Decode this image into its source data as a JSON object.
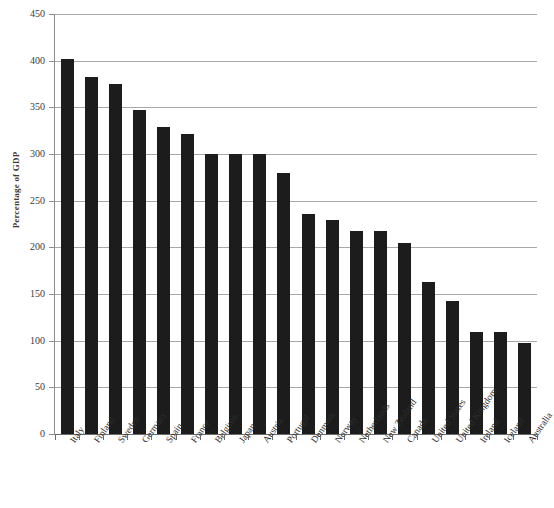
{
  "chart_data": {
    "type": "bar",
    "title": "",
    "xlabel": "",
    "ylabel": "Percentage of GDP",
    "ylim": [
      0,
      450
    ],
    "ytick_step": 50,
    "yticks": [
      "0",
      "50",
      "100",
      "150",
      "200",
      "250",
      "300",
      "350",
      "400",
      "450"
    ],
    "grid": true,
    "legend": "none",
    "bar_color": "#1c1c1c",
    "gridline_color": "#a9a9a9",
    "axis_color": "#6b6b6b",
    "background_color": "#ffffff",
    "categories": [
      "Italy",
      "Finland",
      "Sweden",
      "Germany",
      "Spain",
      "France",
      "Belgium",
      "Japan",
      "Austria",
      "Portugal",
      "Denmark",
      "Norway",
      "Netherlands",
      "New Zealand",
      "Canada",
      "United States",
      "United Kingdom",
      "Ireland",
      "Iceland",
      "Australia"
    ],
    "values": [
      402,
      382,
      375,
      347,
      329,
      321,
      300,
      300,
      300,
      280,
      236,
      229,
      217,
      217,
      205,
      163,
      142,
      109,
      109,
      98
    ]
  }
}
